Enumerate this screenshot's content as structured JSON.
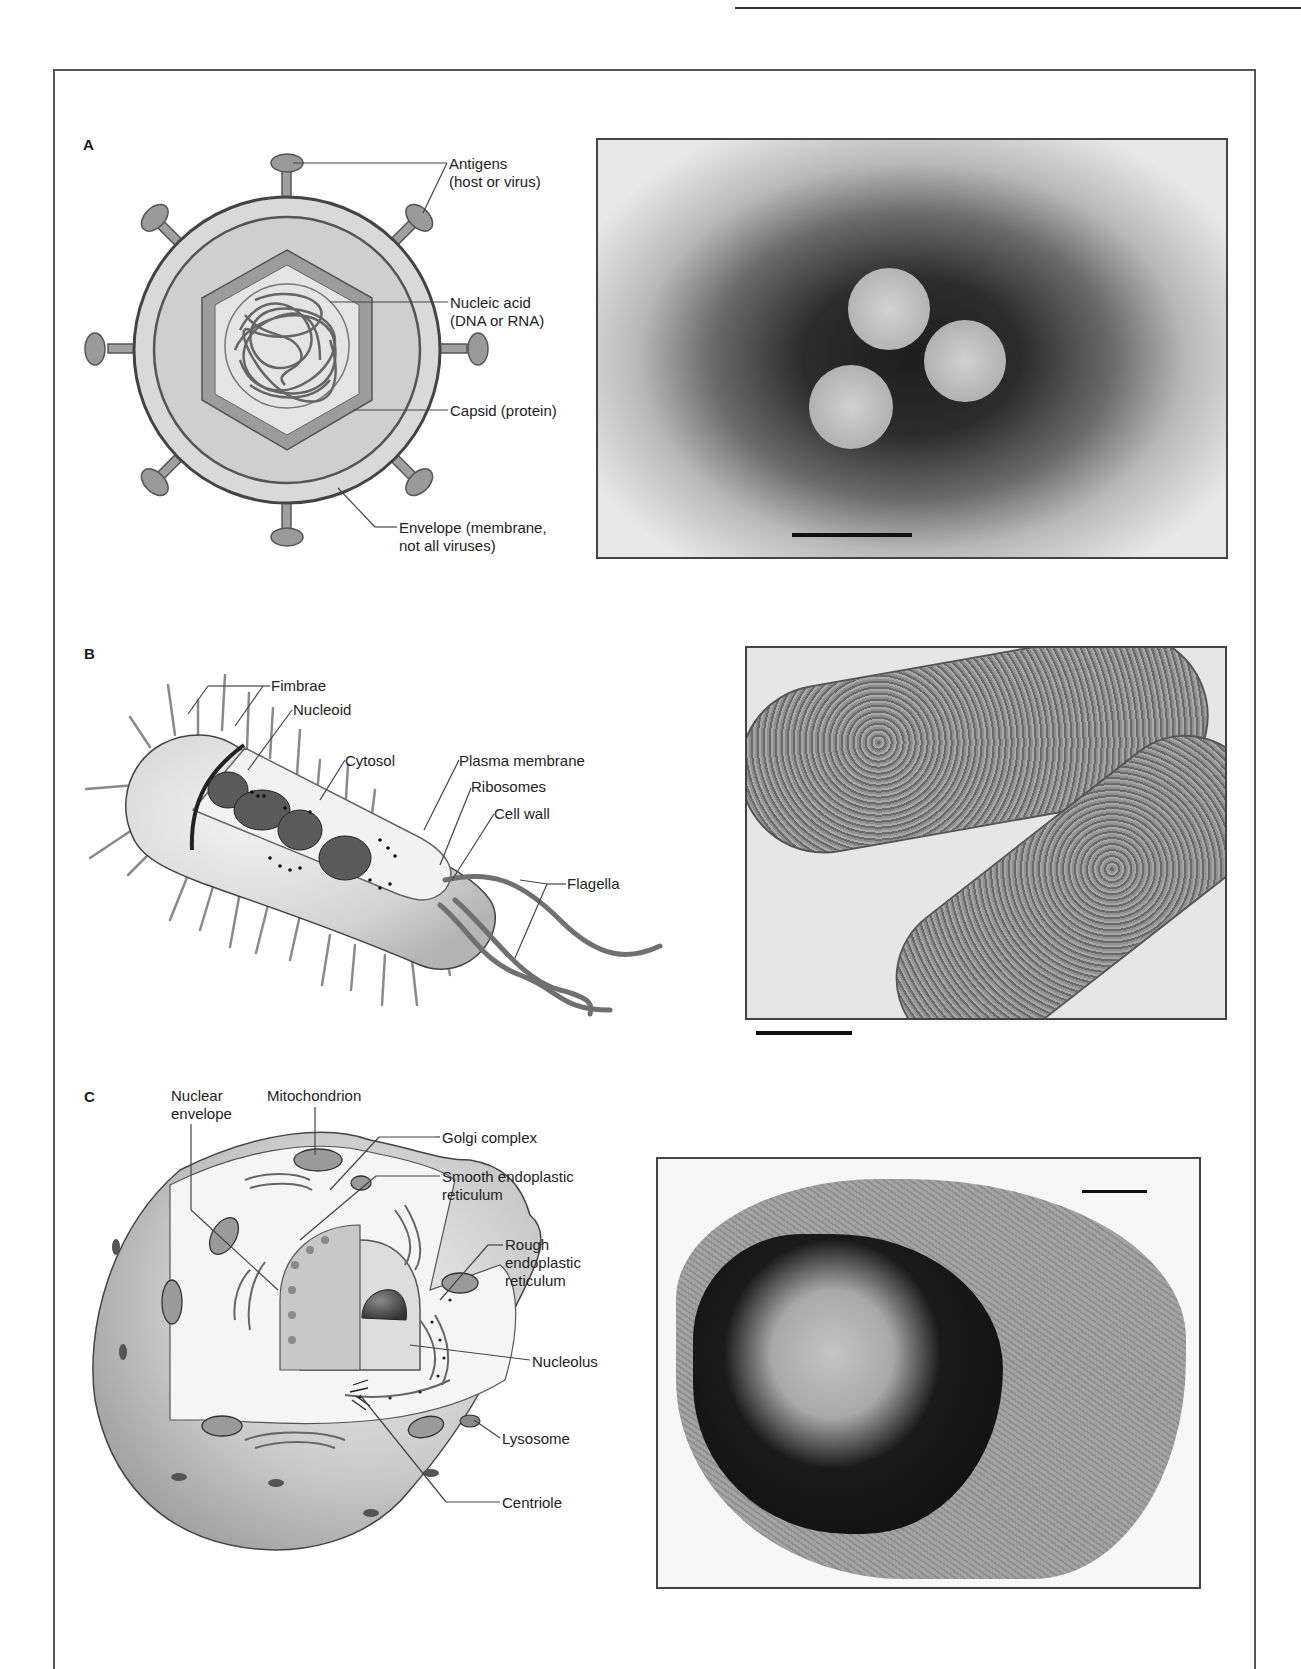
{
  "page": {
    "header_rule": true
  },
  "panels": [
    {
      "id": "A",
      "label": "A",
      "subject": "virus",
      "callouts": [
        {
          "key": "antigens",
          "line1": "Antigens",
          "line2": "(host or virus)"
        },
        {
          "key": "nucleic_acid",
          "line1": "Nucleic acid",
          "line2": "(DNA or RNA)"
        },
        {
          "key": "capsid",
          "line1": "Capsid (protein)",
          "line2": ""
        },
        {
          "key": "envelope",
          "line1": "Envelope (membrane,",
          "line2": "not all viruses)"
        }
      ],
      "micrograph": {
        "description": "electron micrograph of three virus particles",
        "scale_bar": true
      }
    },
    {
      "id": "B",
      "label": "B",
      "subject": "bacterium",
      "callouts": [
        {
          "key": "fimbrae",
          "line1": "Fimbrae"
        },
        {
          "key": "nucleoid",
          "line1": "Nucleoid"
        },
        {
          "key": "cytosol",
          "line1": "Cytosol"
        },
        {
          "key": "plasma_membrane",
          "line1": "Plasma membrane"
        },
        {
          "key": "ribosomes",
          "line1": "Ribosomes"
        },
        {
          "key": "cell_wall",
          "line1": "Cell wall"
        },
        {
          "key": "flagella",
          "line1": "Flagella"
        }
      ],
      "micrograph": {
        "description": "electron micrograph of rod-shaped bacteria",
        "scale_bar": true
      }
    },
    {
      "id": "C",
      "label": "C",
      "subject": "eukaryotic cell",
      "callouts": [
        {
          "key": "nuclear_envelope",
          "line1": "Nuclear",
          "line2": "envelope"
        },
        {
          "key": "mitochondrion",
          "line1": "Mitochondrion"
        },
        {
          "key": "golgi",
          "line1": "Golgi complex"
        },
        {
          "key": "smooth_er",
          "line1": "Smooth endoplastic",
          "line2": "reticulum"
        },
        {
          "key": "rough_er",
          "line1": "Rough",
          "line2": "endoplastic",
          "line3": "reticulum"
        },
        {
          "key": "nucleolus",
          "line1": "Nucleolus"
        },
        {
          "key": "lysosome",
          "line1": "Lysosome"
        },
        {
          "key": "centriole",
          "line1": "Centriole"
        }
      ],
      "micrograph": {
        "description": "electron micrograph of a eukaryotic cell with nucleus",
        "scale_bar": true
      }
    }
  ]
}
